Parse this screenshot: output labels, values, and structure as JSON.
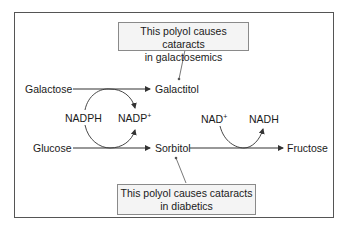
{
  "diagram": {
    "type": "polyol pathway",
    "nodes": {
      "galactose": "Galactose",
      "galactitol": "Galactitol",
      "glucose": "Glucose",
      "sorbitol": "Sorbitol",
      "fructose": "Fructose"
    },
    "cofactors": {
      "nadph": "NADPH",
      "nadp_base": "NADP",
      "nadp_sup": "+",
      "nad_base": "NAD",
      "nad_sup": "+",
      "nadh": "NADH"
    },
    "callouts": {
      "top_line1": "This polyol causes cataracts",
      "top_line2": "in galactosemics",
      "bottom_line1": "This polyol causes cataracts",
      "bottom_line2": "in diabetics"
    },
    "edges": [
      {
        "from": "Galactose",
        "to": "Galactitol"
      },
      {
        "from": "Glucose",
        "to": "Sorbitol"
      },
      {
        "from": "Sorbitol",
        "to": "Fructose"
      }
    ],
    "colors": {
      "line": "#333333",
      "frame": "#555555",
      "callout_bg": "#f4f4f4",
      "callout_border": "#8a8a8a"
    }
  }
}
